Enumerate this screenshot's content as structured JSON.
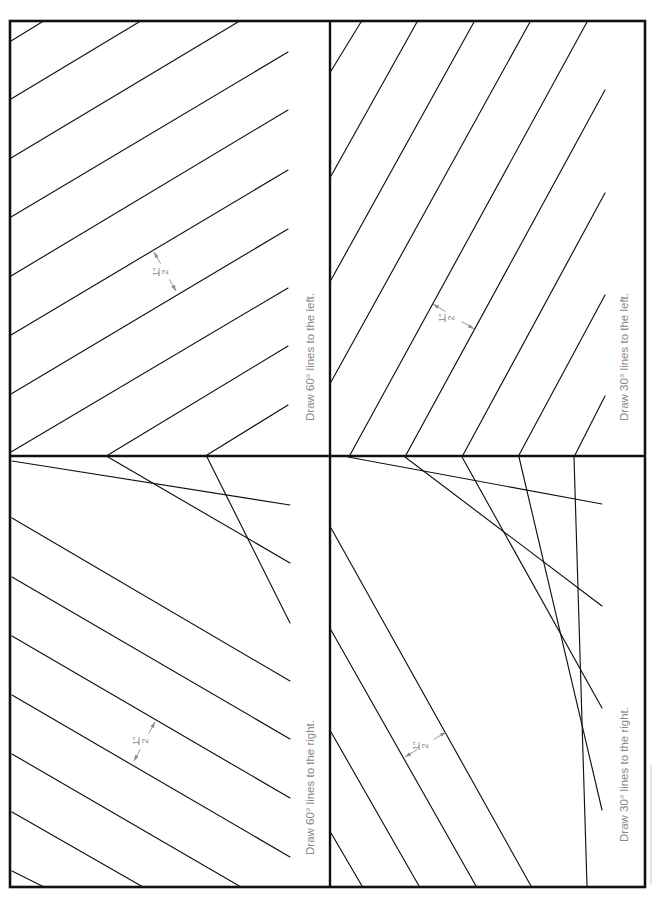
{
  "page": {
    "width": 659,
    "height": 898,
    "frame": {
      "x1": 10,
      "y1": 21,
      "x2": 645,
      "y2": 887
    },
    "dividers": {
      "vertical_x": 330,
      "horizontal_y": 456
    },
    "colors": {
      "ink": "#111111",
      "annotation_gray": "#8a8a8a",
      "background": "#ffffff"
    }
  },
  "quadrants": [
    {
      "id": "top-left",
      "instruction": "Draw 60° lines to the left.",
      "label_pos": {
        "x": 314,
        "y": 421
      },
      "dimension": {
        "text_num": "1\"",
        "text_den": "2",
        "a": [
          154,
          252
        ],
        "b": [
          176,
          291
        ],
        "tx": 160,
        "ty": 272
      },
      "lines": [
        [
          42,
          22,
          11,
          41
        ],
        [
          139,
          22,
          11,
          99
        ],
        [
          238,
          22,
          11,
          158
        ],
        [
          288,
          52,
          11,
          217
        ],
        [
          288,
          110,
          11,
          276
        ],
        [
          288,
          170,
          11,
          335
        ],
        [
          288,
          229,
          11,
          394
        ],
        [
          288,
          288,
          11,
          452
        ],
        [
          288,
          346,
          108,
          455
        ],
        [
          288,
          405,
          207,
          455
        ]
      ]
    },
    {
      "id": "top-right",
      "instruction": "Draw 30° lines to the left.",
      "label_pos": {
        "x": 628,
        "y": 421
      },
      "dimension": {
        "text_num": "1\"",
        "text_den": "2",
        "a": [
          433,
          304
        ],
        "b": [
          474,
          329
        ],
        "tx": 446,
        "ty": 318
      },
      "lines": [
        [
          361,
          22,
          331,
          71
        ],
        [
          417,
          22,
          331,
          176
        ],
        [
          474,
          22,
          331,
          280
        ],
        [
          530,
          22,
          331,
          382
        ],
        [
          587,
          22,
          350,
          455
        ],
        [
          605,
          90,
          406,
          455
        ],
        [
          605,
          193,
          463,
          455
        ],
        [
          605,
          295,
          519,
          455
        ],
        [
          605,
          396,
          575,
          455
        ]
      ]
    },
    {
      "id": "bottom-left",
      "instruction": "Draw 60° lines to the right.",
      "label_pos": {
        "x": 314,
        "y": 855
      },
      "dimension": {
        "text_num": "1\"",
        "text_den": "2",
        "a": [
          134,
          761
        ],
        "b": [
          155,
          722
        ],
        "tx": 140,
        "ty": 741
      },
      "lines": [
        [
          12,
          461,
          290,
          505
        ],
        [
          108,
          457,
          290,
          563
        ],
        [
          207,
          457,
          290,
          623
        ],
        [
          12,
          518,
          290,
          681
        ],
        [
          12,
          577,
          290,
          739
        ],
        [
          12,
          636,
          290,
          798
        ],
        [
          12,
          695,
          290,
          857
        ],
        [
          12,
          754,
          241,
          887
        ],
        [
          12,
          812,
          143,
          887
        ],
        [
          12,
          871,
          44,
          887
        ]
      ]
    },
    {
      "id": "bottom-right",
      "instruction": "Draw 30° lines to the right.",
      "label_pos": {
        "x": 628,
        "y": 842
      },
      "dimension": {
        "text_num": "1\"",
        "text_den": "2",
        "a": [
          405,
          757
        ],
        "b": [
          446,
          732
        ],
        "tx": 420,
        "ty": 746
      },
      "lines": [
        [
          348,
          457,
          602,
          504
        ],
        [
          405,
          457,
          602,
          606
        ],
        [
          462,
          457,
          602,
          708
        ],
        [
          519,
          457,
          602,
          810
        ],
        [
          574,
          457,
          587,
          886
        ],
        [
          331,
          528,
          531,
          886
        ],
        [
          331,
          630,
          476,
          886
        ],
        [
          331,
          732,
          419,
          886
        ],
        [
          331,
          833,
          362,
          886
        ]
      ]
    }
  ]
}
